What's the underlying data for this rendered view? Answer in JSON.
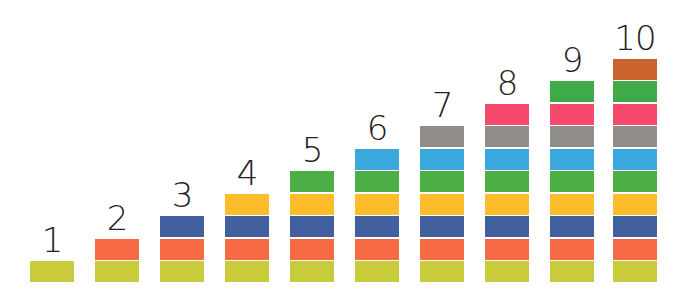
{
  "colors": [
    "#c8cc3a",
    "#f86a44",
    "#42609e",
    "#fbbd2a",
    "#4cae44",
    "#3aa8dc",
    "#8f8c8a",
    "#f4486c",
    "#3faa48",
    "#c9622c"
  ],
  "color_names": [
    "yellow-green",
    "orange",
    "blue",
    "yellow",
    "green",
    "light-blue",
    "gray",
    "pink",
    "green",
    "brown-orange"
  ],
  "columns": [
    {
      "label": "1",
      "count": 1
    },
    {
      "label": "2",
      "count": 2
    },
    {
      "label": "3",
      "count": 3
    },
    {
      "label": "4",
      "count": 4
    },
    {
      "label": "5",
      "count": 5
    },
    {
      "label": "6",
      "count": 6
    },
    {
      "label": "7",
      "count": 7
    },
    {
      "label": "8",
      "count": 8
    },
    {
      "label": "9",
      "count": 9
    },
    {
      "label": "10",
      "count": 10
    }
  ]
}
